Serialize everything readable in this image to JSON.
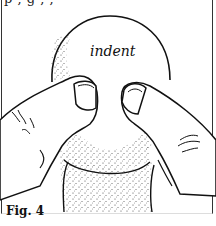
{
  "figure": {
    "top_cut_text": "p           ,    g ,        ,",
    "label_indent": "indent",
    "caption": "Fig. 4"
  },
  "colors": {
    "ink": "#111111",
    "paper": "#ffffff",
    "stipple": "#444444"
  }
}
